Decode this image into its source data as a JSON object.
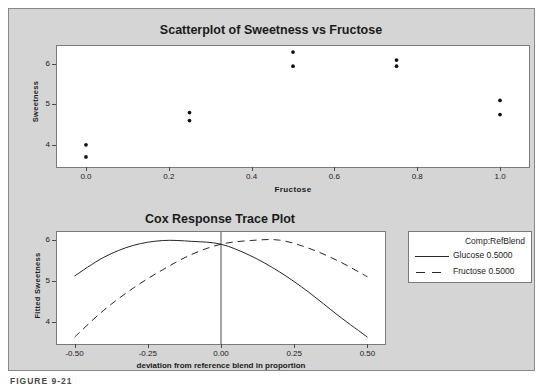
{
  "figure": {
    "caption": "FIGURE 9-21",
    "panel_bg": "#d5d5d5",
    "plot_bg": "#ffffff",
    "frame_color": "#7a7a7a",
    "line_color": "#262626"
  },
  "scatterplot": {
    "title": "Scatterplot of Sweetness vs Fructose",
    "xlabel": "Fructose",
    "ylabel": "Sweetness",
    "xticks": [
      "0.0",
      "0.2",
      "0.4",
      "0.6",
      "0.8",
      "1.0"
    ],
    "yticks": [
      "4",
      "5",
      "6"
    ]
  },
  "cox": {
    "title": "Cox Response Trace Plot",
    "xlabel": "deviation from reference blend in proportion",
    "ylabel": "Fitted Sweetness",
    "xticks": [
      "-0.50",
      "-0.25",
      "0.00",
      "0.25",
      "0.50"
    ],
    "yticks": [
      "4",
      "5",
      "6"
    ],
    "legend": {
      "heading": "Comp:RefBlend",
      "items": [
        {
          "label": "Glucose  0.5000",
          "style": "solid"
        },
        {
          "label": "Fructose  0.5000",
          "style": "dashed"
        }
      ]
    }
  },
  "chart_data": [
    {
      "type": "scatter",
      "title": "Scatterplot of Sweetness vs Fructose",
      "xlabel": "Fructose",
      "ylabel": "Sweetness",
      "xlim": [
        -0.07,
        1.07
      ],
      "ylim": [
        3.45,
        6.45
      ],
      "xticks": [
        0.0,
        0.2,
        0.4,
        0.6,
        0.8,
        1.0
      ],
      "yticks": [
        4,
        5,
        6
      ],
      "grid": false,
      "points": [
        {
          "x": 0.0,
          "y": 4.0
        },
        {
          "x": 0.0,
          "y": 3.7
        },
        {
          "x": 0.25,
          "y": 4.8
        },
        {
          "x": 0.25,
          "y": 4.6
        },
        {
          "x": 0.5,
          "y": 6.3
        },
        {
          "x": 0.5,
          "y": 5.95
        },
        {
          "x": 0.75,
          "y": 6.1
        },
        {
          "x": 0.75,
          "y": 5.95
        },
        {
          "x": 1.0,
          "y": 5.1
        },
        {
          "x": 1.0,
          "y": 4.75
        }
      ]
    },
    {
      "type": "line",
      "title": "Cox Response Trace Plot",
      "xlabel": "deviation from reference blend in proportion",
      "ylabel": "Fitted Sweetness",
      "xlim": [
        -0.56,
        0.56
      ],
      "ylim": [
        3.45,
        6.2
      ],
      "xticks": [
        -0.5,
        -0.25,
        0.0,
        0.25,
        0.5
      ],
      "yticks": [
        4,
        5,
        6
      ],
      "grid": false,
      "reference_line_x": 0.0,
      "legend_position": "right-outside",
      "series": [
        {
          "name": "Glucose  0.5000",
          "style": "solid",
          "x": [
            -0.5,
            -0.4,
            -0.3,
            -0.2,
            -0.1,
            0.0,
            0.1,
            0.2,
            0.3,
            0.4,
            0.5
          ],
          "y": [
            5.12,
            5.58,
            5.87,
            5.99,
            5.97,
            5.9,
            5.62,
            5.22,
            4.72,
            4.15,
            3.62
          ]
        },
        {
          "name": "Fructose  0.5000",
          "style": "dashed",
          "x": [
            -0.5,
            -0.4,
            -0.3,
            -0.2,
            -0.1,
            0.0,
            0.1,
            0.2,
            0.3,
            0.4,
            0.5
          ],
          "y": [
            3.62,
            4.28,
            4.82,
            5.27,
            5.65,
            5.9,
            5.99,
            6.0,
            5.8,
            5.49,
            5.1
          ]
        }
      ]
    }
  ]
}
